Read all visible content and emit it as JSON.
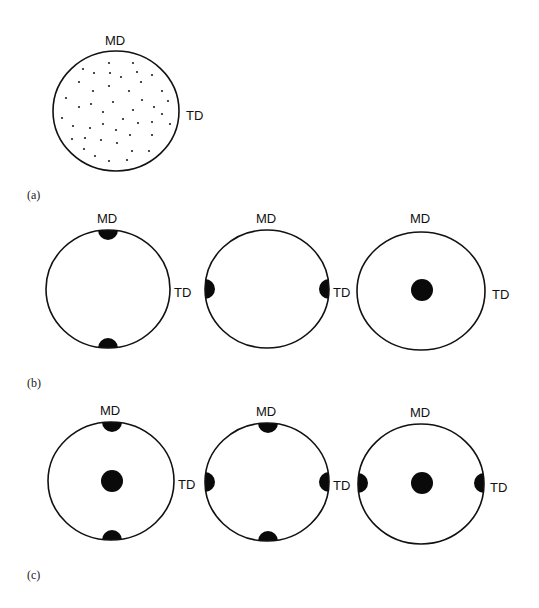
{
  "figure": {
    "panels": [
      {
        "id": "a",
        "label": "(a)",
        "label_pos": [
          27,
          199
        ],
        "figures": [
          {
            "name": "random-orientation",
            "center": [
              116,
              111
            ],
            "rx": 63,
            "ry": 60,
            "md_label": "MD",
            "md_pos": [
              105,
              45
            ],
            "td_label": "TD",
            "td_pos": [
              186,
              120
            ],
            "stipple": [
              [
                109,
                63
              ],
              [
                133,
                63
              ],
              [
                83,
                69
              ],
              [
                94,
                73
              ],
              [
                110,
                73
              ],
              [
                137,
                72
              ],
              [
                152,
                75
              ],
              [
                121,
                77
              ],
              [
                79,
                82
              ],
              [
                109,
                86
              ],
              [
                141,
                82
              ],
              [
                93,
                91
              ],
              [
                129,
                91
              ],
              [
                162,
                91
              ],
              [
                66,
                98
              ],
              [
                91,
                104
              ],
              [
                113,
                102
              ],
              [
                142,
                100
              ],
              [
                168,
                101
              ],
              [
                79,
                107
              ],
              [
                154,
                107
              ],
              [
                103,
                112
              ],
              [
                133,
                110
              ],
              [
                162,
                114
              ],
              [
                62,
                118
              ],
              [
                123,
                119
              ],
              [
                138,
                123
              ],
              [
                152,
                122
              ],
              [
                170,
                124
              ],
              [
                73,
                126
              ],
              [
                90,
                128
              ],
              [
                103,
                124
              ],
              [
                116,
                130
              ],
              [
                130,
                135
              ],
              [
                152,
                135
              ],
              [
                72,
                139
              ],
              [
                85,
                138
              ],
              [
                101,
                140
              ],
              [
                117,
                143
              ],
              [
                84,
                149
              ],
              [
                132,
                151
              ],
              [
                149,
                151
              ],
              [
                95,
                156
              ],
              [
                109,
                161
              ],
              [
                127,
                160
              ]
            ],
            "poles": []
          }
        ]
      },
      {
        "id": "b",
        "label": "(b)",
        "label_pos": [
          27,
          387
        ],
        "figures": [
          {
            "name": "md-poles",
            "center": [
              108,
              289
            ],
            "rx": 62,
            "ry": 59,
            "md_label": "MD",
            "md_pos": [
              97,
              223
            ],
            "td_label": "TD",
            "td_pos": [
              174,
              297
            ],
            "poles": [
              {
                "type": "edge-top",
                "cx": 108,
                "cy": 230,
                "r": 10
              },
              {
                "type": "edge-bottom",
                "cx": 108,
                "cy": 348,
                "r": 10
              }
            ]
          },
          {
            "name": "td-poles",
            "center": [
              267,
              289
            ],
            "rx": 62,
            "ry": 59,
            "md_label": "MD",
            "md_pos": [
              256,
              223
            ],
            "td_label": "TD",
            "td_pos": [
              333,
              297
            ],
            "poles": [
              {
                "type": "edge-left",
                "cx": 205,
                "cy": 289,
                "r": 10
              },
              {
                "type": "edge-right",
                "cx": 329,
                "cy": 289,
                "r": 10
              }
            ]
          },
          {
            "name": "normal-pole",
            "center": [
              421,
              291
            ],
            "rx": 64,
            "ry": 59,
            "md_label": "MD",
            "md_pos": [
              410,
              223
            ],
            "td_label": "TD",
            "td_pos": [
              492,
              299
            ],
            "poles": [
              {
                "type": "center",
                "cx": 422,
                "cy": 290,
                "r": 11
              }
            ]
          }
        ]
      },
      {
        "id": "c",
        "label": "(c)",
        "label_pos": [
          27,
          579
        ],
        "figures": [
          {
            "name": "md-and-normal-poles",
            "center": [
              111,
              481
            ],
            "rx": 63,
            "ry": 59,
            "md_label": "MD",
            "md_pos": [
              100,
              415
            ],
            "td_label": "TD",
            "td_pos": [
              178,
              489
            ],
            "poles": [
              {
                "type": "edge-top",
                "cx": 112,
                "cy": 422,
                "r": 10
              },
              {
                "type": "center",
                "cx": 112,
                "cy": 481,
                "r": 11
              },
              {
                "type": "edge-bottom",
                "cx": 112,
                "cy": 540,
                "r": 10
              }
            ]
          },
          {
            "name": "md-and-td-poles",
            "center": [
              267,
              482
            ],
            "rx": 62,
            "ry": 59,
            "md_label": "MD",
            "md_pos": [
              256,
              416
            ],
            "td_label": "TD",
            "td_pos": [
              333,
              490
            ],
            "poles": [
              {
                "type": "edge-top",
                "cx": 268,
                "cy": 423,
                "r": 10
              },
              {
                "type": "edge-left",
                "cx": 205,
                "cy": 482,
                "r": 10
              },
              {
                "type": "edge-right",
                "cx": 329,
                "cy": 482,
                "r": 10
              },
              {
                "type": "edge-bottom",
                "cx": 268,
                "cy": 541,
                "r": 10
              }
            ]
          },
          {
            "name": "td-and-normal-poles",
            "center": [
              421,
              484
            ],
            "rx": 63,
            "ry": 60,
            "md_label": "MD",
            "md_pos": [
              410,
              417
            ],
            "td_label": "TD",
            "td_pos": [
              490,
              492
            ],
            "poles": [
              {
                "type": "edge-left",
                "cx": 358,
                "cy": 483,
                "r": 10
              },
              {
                "type": "center",
                "cx": 422,
                "cy": 483,
                "r": 11
              },
              {
                "type": "edge-right",
                "cx": 484,
                "cy": 483,
                "r": 10
              }
            ]
          }
        ]
      }
    ]
  }
}
